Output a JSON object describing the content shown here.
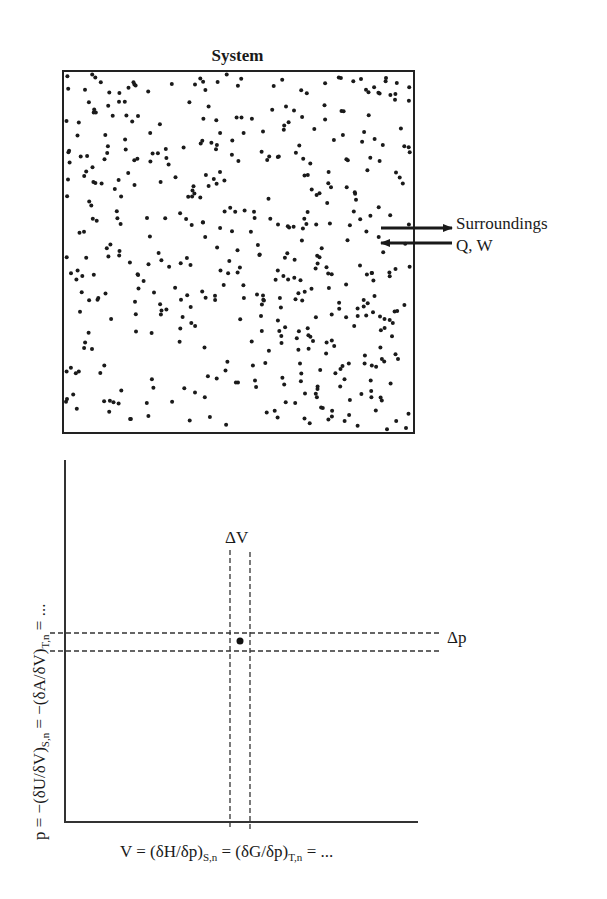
{
  "system": {
    "title": "System",
    "particle_count": 480,
    "particle_seed": 7,
    "particle_color": "#1a1a1a",
    "box": {
      "x": 62,
      "y": 70,
      "width": 351,
      "height": 362
    }
  },
  "surroundings": {
    "label": "Surroundings",
    "exchange_label": "Q, W",
    "arrows": [
      {
        "direction": "out",
        "y": 228
      },
      {
        "direction": "in",
        "y": 243
      }
    ]
  },
  "chart_data": {
    "type": "scatter",
    "title": "",
    "xlabel": "V = (δH/δp)S,n = (δG/δp)T,n = ...",
    "ylabel": "p = −(δU/δV)S,n = −(δA/δV)T,n = ...",
    "xlabel_parts": {
      "pre": "V = (δH/δp)",
      "sub1": "S,n",
      "mid": " = (δG/δp)",
      "sub2": "T,n",
      "post": " = ..."
    },
    "ylabel_parts": {
      "pre": "p = −(δU/δV)",
      "sub1": "S,n",
      "mid": " = −(δA/δV)",
      "sub2": "T,n",
      "post": " = ..."
    },
    "annotations": [
      {
        "text": "ΔV",
        "meaning": "volume interval band (two vertical dashed lines)"
      },
      {
        "text": "Δp",
        "meaning": "pressure interval band (two horizontal dashed lines)"
      }
    ],
    "points": [
      {
        "x": "V",
        "y": "p",
        "label": "state point"
      }
    ],
    "grid": false,
    "ticks": "none",
    "dv_label": "ΔV",
    "dp_label": "Δp"
  }
}
